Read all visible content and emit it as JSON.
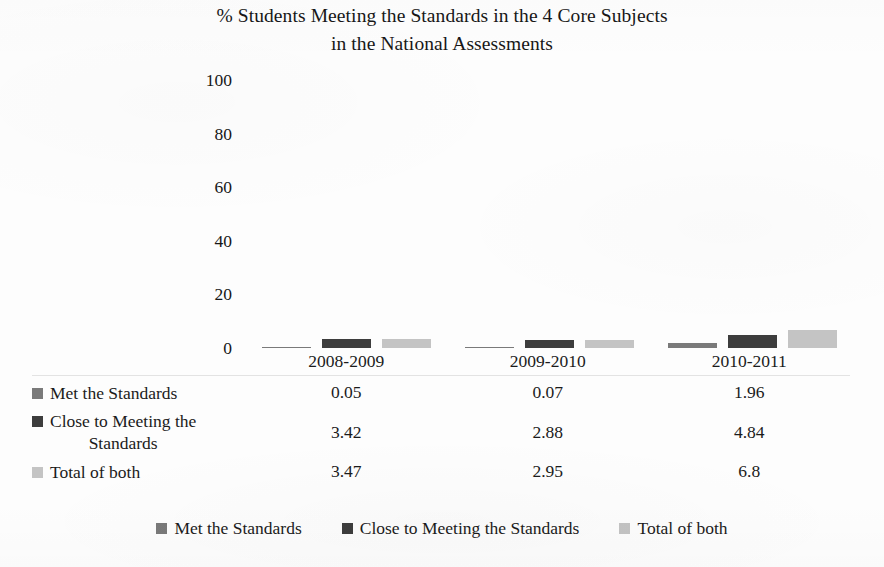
{
  "chart_data": {
    "type": "bar",
    "title": "% Students Meeting the Standards in the 4 Core Subjects in the National Assessments",
    "title_lines": [
      "% Students Meeting the Standards in the 4 Core Subjects",
      "in the National Assessments"
    ],
    "xlabel": "",
    "ylabel": "",
    "ylim": [
      0,
      100
    ],
    "yticks": [
      "100",
      "80",
      "60",
      "40",
      "20",
      "0"
    ],
    "grid": false,
    "legend_position": "bottom",
    "has_data_table": true,
    "categories": [
      "2008-2009",
      "2009-2010",
      "2010-2011"
    ],
    "series": [
      {
        "name": "Met the Standards",
        "color": "#7a7a7a",
        "values": [
          0.05,
          0.07,
          1.96
        ],
        "value_labels": [
          "0.05",
          "0.07",
          "1.96"
        ]
      },
      {
        "name": "Close to Meeting the Standards",
        "name_lines": [
          "Close to Meeting the",
          "Standards"
        ],
        "color": "#3d3d3d",
        "values": [
          3.42,
          2.88,
          4.84
        ],
        "value_labels": [
          "3.42",
          "2.88",
          "4.84"
        ]
      },
      {
        "name": "Total of both",
        "color": "#c4c4c4",
        "values": [
          3.47,
          2.95,
          6.8
        ],
        "value_labels": [
          "3.47",
          "2.95",
          "6.8"
        ]
      }
    ]
  },
  "legend": {
    "items": [
      {
        "label": "Met the Standards",
        "color": "#7a7a7a"
      },
      {
        "label": "Close to Meeting the Standards",
        "color": "#3d3d3d"
      },
      {
        "label": "Total of both",
        "color": "#c4c4c4"
      }
    ]
  }
}
